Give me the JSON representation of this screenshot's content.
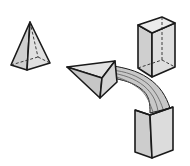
{
  "figure": {
    "shapes": [
      {
        "name": "pyramid",
        "label": ""
      },
      {
        "name": "box-top-right",
        "label": ""
      },
      {
        "name": "arrowhead",
        "label": ""
      },
      {
        "name": "box-bottom-right",
        "label": ""
      }
    ]
  },
  "colors": {
    "background": "#ffffff",
    "fill_light": "#d9d9d9",
    "fill_mid": "#c4c4c4",
    "fill_dark": "#b0b0b0",
    "stroke": "#1a1a1a"
  }
}
